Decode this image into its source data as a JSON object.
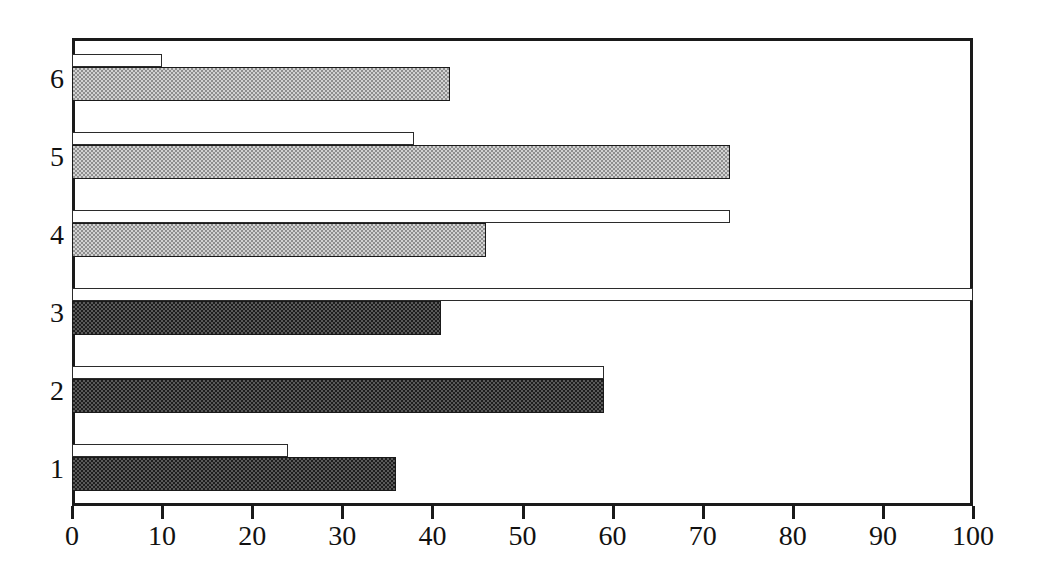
{
  "chart_data": {
    "type": "bar",
    "orientation": "horizontal",
    "title": "",
    "subtitle": "",
    "xlabel": "",
    "ylabel": "",
    "xlim": [
      0,
      100
    ],
    "ylim": [
      0,
      6
    ],
    "grid": false,
    "legend": false,
    "legend_position": "none",
    "categories": [
      "1",
      "2",
      "3",
      "4",
      "5",
      "6"
    ],
    "x_ticks": [
      0,
      10,
      20,
      30,
      40,
      50,
      60,
      70,
      80,
      90,
      100
    ],
    "x_tick_labels": [
      "0",
      "10",
      "20",
      "30",
      "40",
      "50",
      "60",
      "70",
      "80",
      "90",
      "100"
    ],
    "y_tick_labels": [
      "1",
      "2",
      "3",
      "4",
      "5",
      "6"
    ],
    "series": [
      {
        "name": "upper-outline-series",
        "style": "outline",
        "fill": "#ffffff",
        "edge": "#2b2b2b",
        "values": [
          24,
          59,
          100,
          73,
          38,
          10
        ]
      },
      {
        "name": "lower-filled-series",
        "style": "filled",
        "fill_dark": "#1f1f1f",
        "fill_light": "#d2d2d2",
        "edge": "#1a1a1a",
        "values": [
          36,
          59,
          41,
          46,
          73,
          42
        ],
        "shades": [
          "dark",
          "dark",
          "dark",
          "light",
          "light",
          "light"
        ]
      }
    ],
    "bars": [
      {
        "category": "6",
        "outline_value": 10,
        "fill_value": 42,
        "fill_shade": "light"
      },
      {
        "category": "5",
        "outline_value": 38,
        "fill_value": 73,
        "fill_shade": "light"
      },
      {
        "category": "4",
        "outline_value": 73,
        "fill_value": 46,
        "fill_shade": "light"
      },
      {
        "category": "3",
        "outline_value": 100,
        "fill_value": 41,
        "fill_shade": "dark"
      },
      {
        "category": "2",
        "outline_value": 59,
        "fill_value": 59,
        "fill_shade": "dark"
      },
      {
        "category": "1",
        "outline_value": 24,
        "fill_value": 36,
        "fill_shade": "dark"
      }
    ],
    "colors": {
      "axis": "#1a1a1a",
      "text": "#111111",
      "background": "#ffffff",
      "bar_outline_fill": "#ffffff",
      "bar_light_fill": "#d2d2d2",
      "bar_dark_fill": "#1f1f1f"
    }
  }
}
